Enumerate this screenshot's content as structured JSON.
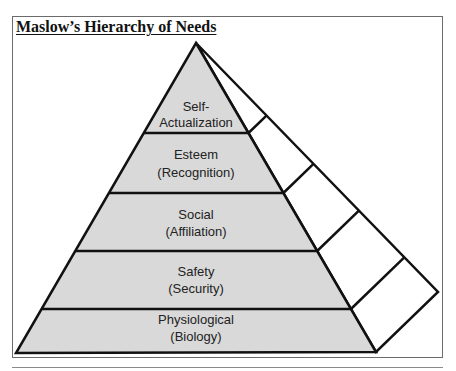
{
  "title": "Maslow’s Hierarchy of Needs",
  "colors": {
    "front_fill": "#d9d9d9",
    "side_fill": "#ffffff",
    "stroke": "#111111"
  },
  "levels": [
    {
      "name": "Self-",
      "sub": "Actualization"
    },
    {
      "name": "Esteem",
      "sub": "(Recognition)"
    },
    {
      "name": "Social",
      "sub": "(Affiliation)"
    },
    {
      "name": "Safety",
      "sub": "(Security)"
    },
    {
      "name": "Physiological",
      "sub": "(Biology)"
    }
  ]
}
